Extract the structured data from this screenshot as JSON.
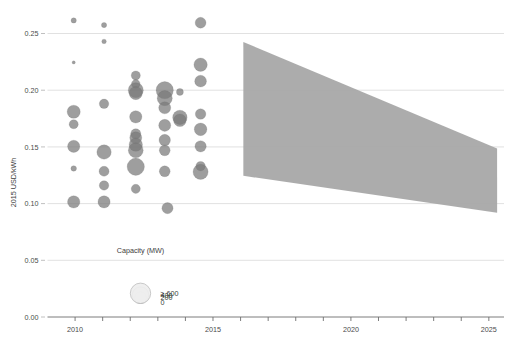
{
  "chart_data": {
    "type": "scatter",
    "title": "",
    "xlabel": "",
    "ylabel": "2015 USD/kWh",
    "xlim": [
      2008.6,
      2025.8
    ],
    "ylim": [
      0.0,
      0.268
    ],
    "grid": true,
    "x_ticks": [
      2010,
      2015,
      2020,
      2025
    ],
    "x_tick_labels": [
      "2010",
      "2015",
      "2020",
      "2025"
    ],
    "x_minor_ticks": [
      2011,
      2012,
      2013,
      2014,
      2016,
      2017,
      2018,
      2019,
      2021,
      2022,
      2023,
      2024
    ],
    "y_ticks": [
      0.0,
      0.05,
      0.1,
      0.15,
      0.2,
      0.25
    ],
    "y_tick_labels": [
      "0.00",
      "0.05",
      "0.10",
      "0.15",
      "0.20",
      "0.25"
    ],
    "size_legend": {
      "title": "Capacity (MW)",
      "entries": [
        {
          "label": "0",
          "value": 0
        },
        {
          "label": "200",
          "value": 200
        },
        {
          "label": "400",
          "value": 400
        },
        {
          "label": "≥ 600",
          "value": 600
        }
      ]
    },
    "series": [
      {
        "name": "Projects",
        "marker": "circle",
        "color": "#787878",
        "size_field": "capacity_mw",
        "points": [
          {
            "x": 2009.95,
            "y": 0.2615,
            "capacity_mw": 40
          },
          {
            "x": 2011.05,
            "y": 0.2575,
            "capacity_mw": 40
          },
          {
            "x": 2011.05,
            "y": 0.243,
            "capacity_mw": 30
          },
          {
            "x": 2014.55,
            "y": 0.2595,
            "capacity_mw": 170
          },
          {
            "x": 2009.95,
            "y": 0.2245,
            "capacity_mw": 15
          },
          {
            "x": 2012.2,
            "y": 0.213,
            "capacity_mw": 120
          },
          {
            "x": 2014.55,
            "y": 0.2225,
            "capacity_mw": 260
          },
          {
            "x": 2012.2,
            "y": 0.2055,
            "capacity_mw": 110
          },
          {
            "x": 2014.55,
            "y": 0.208,
            "capacity_mw": 200
          },
          {
            "x": 2012.2,
            "y": 0.2,
            "capacity_mw": 330
          },
          {
            "x": 2012.2,
            "y": 0.1975,
            "capacity_mw": 250
          },
          {
            "x": 2013.25,
            "y": 0.2,
            "capacity_mw": 430
          },
          {
            "x": 2013.25,
            "y": 0.193,
            "capacity_mw": 330
          },
          {
            "x": 2013.8,
            "y": 0.1985,
            "capacity_mw": 70
          },
          {
            "x": 2011.05,
            "y": 0.188,
            "capacity_mw": 130
          },
          {
            "x": 2013.25,
            "y": 0.1845,
            "capacity_mw": 210
          },
          {
            "x": 2009.95,
            "y": 0.181,
            "capacity_mw": 250
          },
          {
            "x": 2014.55,
            "y": 0.179,
            "capacity_mw": 160
          },
          {
            "x": 2012.2,
            "y": 0.1765,
            "capacity_mw": 220
          },
          {
            "x": 2013.8,
            "y": 0.176,
            "capacity_mw": 300
          },
          {
            "x": 2013.8,
            "y": 0.1735,
            "capacity_mw": 230
          },
          {
            "x": 2009.95,
            "y": 0.17,
            "capacity_mw": 120
          },
          {
            "x": 2013.25,
            "y": 0.169,
            "capacity_mw": 210
          },
          {
            "x": 2014.55,
            "y": 0.1655,
            "capacity_mw": 230
          },
          {
            "x": 2012.2,
            "y": 0.1615,
            "capacity_mw": 150
          },
          {
            "x": 2012.2,
            "y": 0.158,
            "capacity_mw": 210
          },
          {
            "x": 2013.25,
            "y": 0.156,
            "capacity_mw": 190
          },
          {
            "x": 2014.55,
            "y": 0.1505,
            "capacity_mw": 185
          },
          {
            "x": 2009.95,
            "y": 0.1505,
            "capacity_mw": 215
          },
          {
            "x": 2012.2,
            "y": 0.152,
            "capacity_mw": 260
          },
          {
            "x": 2012.2,
            "y": 0.147,
            "capacity_mw": 320
          },
          {
            "x": 2011.05,
            "y": 0.1455,
            "capacity_mw": 300
          },
          {
            "x": 2013.25,
            "y": 0.147,
            "capacity_mw": 170
          },
          {
            "x": 2014.55,
            "y": 0.133,
            "capacity_mw": 130
          },
          {
            "x": 2012.2,
            "y": 0.1325,
            "capacity_mw": 430
          },
          {
            "x": 2009.95,
            "y": 0.131,
            "capacity_mw": 45
          },
          {
            "x": 2011.05,
            "y": 0.1285,
            "capacity_mw": 145
          },
          {
            "x": 2013.25,
            "y": 0.1285,
            "capacity_mw": 170
          },
          {
            "x": 2014.55,
            "y": 0.128,
            "capacity_mw": 330
          },
          {
            "x": 2011.05,
            "y": 0.116,
            "capacity_mw": 130
          },
          {
            "x": 2012.2,
            "y": 0.113,
            "capacity_mw": 120
          },
          {
            "x": 2009.95,
            "y": 0.1015,
            "capacity_mw": 220
          },
          {
            "x": 2011.05,
            "y": 0.1015,
            "capacity_mw": 215
          },
          {
            "x": 2013.35,
            "y": 0.096,
            "capacity_mw": 180
          }
        ]
      }
    ],
    "band": {
      "name": "projection-range",
      "color": "#a8a8a8",
      "x_start": 2016.1,
      "x_end": 2025.3,
      "upper_start": 0.2425,
      "upper_end": 0.1485,
      "lower_start": 0.1245,
      "lower_end": 0.092
    }
  }
}
